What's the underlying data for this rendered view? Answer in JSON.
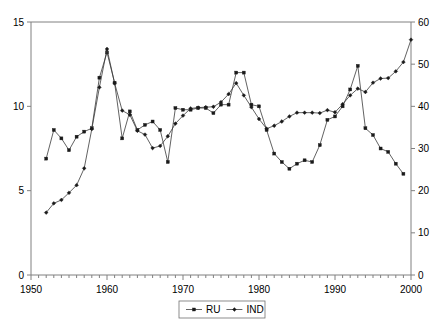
{
  "figure": {
    "background_color": "#ffffff",
    "axis_color": "#808080",
    "line_color": "#3a3a3a",
    "marker_color": "#1a1a1a"
  },
  "legend": {
    "position": "bottom-center",
    "entries": [
      {
        "label": "RU",
        "axis": "left"
      },
      {
        "label": "IND",
        "axis": "right"
      }
    ]
  },
  "caption": {
    "text": ""
  },
  "chart_data": {
    "type": "line",
    "title": "",
    "subtitle": "",
    "xlabel": "",
    "ylabel": "",
    "y2label": "",
    "grid": false,
    "legend_position": "bottom-center",
    "xlim": [
      1950,
      2000
    ],
    "ylim": [
      0,
      15
    ],
    "y2lim": [
      0,
      60
    ],
    "xticks": [
      1950,
      1960,
      1970,
      1980,
      1990,
      2000
    ],
    "xtick_labels": [
      "1950",
      "1960",
      "1970",
      "1980",
      "1990",
      "2000"
    ],
    "x_minor_tick_step": 1,
    "yticks": [
      0,
      5,
      10,
      15
    ],
    "ytick_labels": [
      "0",
      "5",
      "10",
      "15"
    ],
    "y2ticks": [
      0,
      10,
      20,
      30,
      40,
      50,
      60
    ],
    "y2tick_labels": [
      "0",
      "10",
      "20",
      "30",
      "40",
      "50",
      "60"
    ],
    "series": [
      {
        "name": "RU",
        "axis": "left",
        "marker": "square",
        "x": [
          1952,
          1953,
          1954,
          1955,
          1956,
          1957,
          1958,
          1959,
          1960,
          1961,
          1962,
          1963,
          1964,
          1965,
          1966,
          1967,
          1968,
          1969,
          1970,
          1971,
          1972,
          1973,
          1974,
          1975,
          1976,
          1977,
          1978,
          1979,
          1980,
          1981,
          1982,
          1983,
          1984,
          1985,
          1986,
          1987,
          1988,
          1989,
          1990,
          1991,
          1992,
          1993,
          1994,
          1995,
          1996,
          1997,
          1998,
          1999
        ],
        "values": [
          6.9,
          8.6,
          8.1,
          7.4,
          8.2,
          8.5,
          8.7,
          11.7,
          13.2,
          11.4,
          8.1,
          9.7,
          8.6,
          8.9,
          9.1,
          8.6,
          6.7,
          9.9,
          9.8,
          9.8,
          9.9,
          9.9,
          9.6,
          10.1,
          10.1,
          12.0,
          12.0,
          10.1,
          10.0,
          8.6,
          7.2,
          6.7,
          6.3,
          6.6,
          6.8,
          6.7,
          7.7,
          9.2,
          9.4,
          10.0,
          11.0,
          12.4,
          8.7,
          8.3,
          7.5,
          7.3,
          6.6,
          6.0
        ]
      },
      {
        "name": "IND",
        "axis": "right",
        "marker": "diamond",
        "x": [
          1952,
          1953,
          1954,
          1955,
          1956,
          1957,
          1958,
          1959,
          1960,
          1961,
          1962,
          1963,
          1964,
          1965,
          1966,
          1967,
          1968,
          1969,
          1970,
          1971,
          1972,
          1973,
          1974,
          1975,
          1976,
          1977,
          1978,
          1979,
          1980,
          1981,
          1982,
          1983,
          1984,
          1985,
          1986,
          1987,
          1988,
          1989,
          1990,
          1991,
          1992,
          1993,
          1994,
          1995,
          1996,
          1997,
          1998,
          1999,
          2000
        ],
        "values": [
          14.8,
          17.0,
          17.8,
          19.5,
          21.3,
          25.3,
          34.6,
          44.5,
          53.6,
          45.5,
          39.0,
          38.0,
          34.2,
          33.3,
          30.1,
          30.6,
          32.9,
          35.9,
          37.8,
          39.5,
          39.7,
          39.8,
          39.9,
          41.0,
          42.9,
          45.5,
          42.6,
          39.8,
          37.0,
          34.7,
          35.4,
          36.4,
          37.6,
          38.5,
          38.5,
          38.5,
          38.4,
          39.1,
          38.6,
          40.5,
          42.6,
          44.2,
          43.4,
          45.6,
          46.6,
          46.7,
          48.3,
          50.5,
          55.8
        ]
      }
    ]
  }
}
